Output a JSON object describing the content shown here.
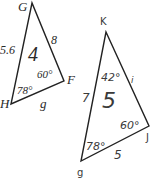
{
  "triangles": [
    {
      "id": "4",
      "number": "4",
      "vertices": {
        "G": "G",
        "H": "H",
        "F": "F"
      },
      "sides": {
        "GH": "5.6",
        "GF": "8",
        "HF": "g"
      },
      "angles": {
        "H": "78°",
        "F": "60°"
      }
    },
    {
      "id": "5",
      "number": "5",
      "vertices": {
        "K": "K",
        "J": "J",
        "bottom": "g"
      },
      "sides": {
        "left": "7",
        "KJ": "i",
        "bottom": "5"
      },
      "angles": {
        "K": "42°",
        "J": "60°",
        "bottom": "78°"
      }
    }
  ],
  "colors": {
    "stroke": "#222222",
    "text": "#2a2a2a"
  }
}
